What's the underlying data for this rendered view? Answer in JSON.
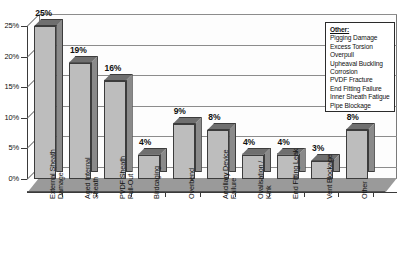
{
  "chart_data": {
    "type": "bar",
    "title": "",
    "xlabel": "",
    "ylabel": "",
    "ylim": [
      0,
      25
    ],
    "grid": true,
    "legend_position": "top-right",
    "categories": [
      "External Sheath\nDamage",
      "Aged Internal\nSheath",
      "PVDF Sheath\nPull-Out",
      "Birdcaging",
      "Overbend",
      "Ancillary Device\nFailure",
      "Ovalisation /\nKink",
      "End Fitting Leak",
      "Vent Blockage",
      "Other"
    ],
    "values": [
      25,
      19,
      16,
      4,
      9,
      8,
      4,
      4,
      3,
      8
    ],
    "data_labels": [
      "25%",
      "19%",
      "16%",
      "4%",
      "9%",
      "8%",
      "4%",
      "4%",
      "3%",
      "8%"
    ],
    "y_ticks": [
      0,
      5,
      10,
      15,
      20,
      25
    ],
    "y_tick_labels": [
      "0%",
      "5%",
      "10%",
      "15%",
      "20%",
      "25%"
    ]
  },
  "legend": {
    "title": "Other:",
    "items": [
      "Pigging Damage",
      "Excess Torsion",
      "Overpull",
      "Upheaval Buckling",
      "Corrosion",
      "PVDF Fracture",
      "End Fitting Failure",
      "Inner Sheath Fatigue",
      "Pipe Blockage"
    ]
  },
  "colors": {
    "bar_front": "#bdbdbd",
    "bar_side": "#8a8a8a",
    "bar_top": "#6f6f6f",
    "floor": "#9a9a9a",
    "gridline": "#8c8c8c",
    "axis": "#3a3a3a",
    "background": "#ffffff"
  }
}
